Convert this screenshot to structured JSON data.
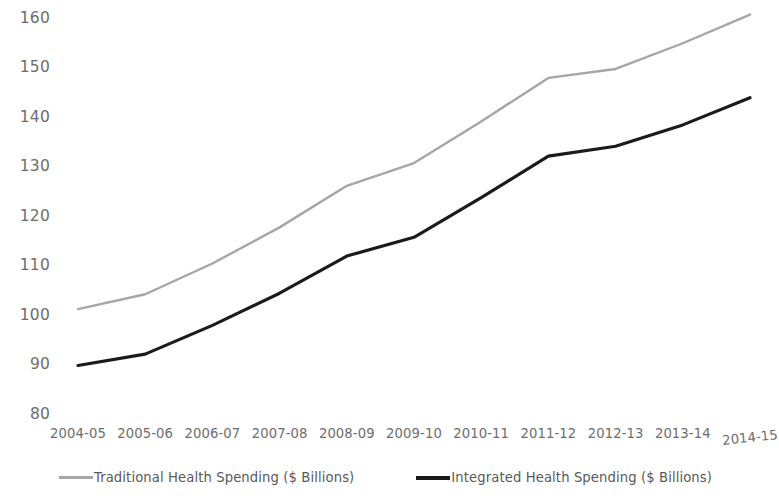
{
  "chart_data": {
    "type": "line",
    "title": "",
    "subtitle": "",
    "xlabel": "",
    "ylabel": "",
    "categories": [
      "2004-05",
      "2005-06",
      "2006-07",
      "2007-08",
      "2008-09",
      "2009-10",
      "2010-11",
      "2011-12",
      "2012-13",
      "2013-14",
      "2014-15"
    ],
    "series": [
      {
        "name": "Traditional Health Spending ($ Billions)",
        "color": "#a6a6a6",
        "values": [
          101.3,
          104.3,
          110.5,
          117.8,
          126.2,
          130.8,
          139.2,
          148.0,
          149.8,
          155.0,
          160.8
        ]
      },
      {
        "name": "Integrated Health Spending ($ Billions)",
        "color": "#1a1a1a",
        "values": [
          89.9,
          92.2,
          98.0,
          104.5,
          112.0,
          115.8,
          123.8,
          132.2,
          134.2,
          138.5,
          144.0
        ]
      }
    ],
    "ylim": [
      80,
      160
    ],
    "ytick_values": [
      80,
      90,
      100,
      110,
      120,
      130,
      140,
      150,
      160
    ],
    "ytick_labels": [
      "80",
      "90",
      "100",
      "110",
      "120",
      "130",
      "140",
      "150",
      "160"
    ],
    "grid": false,
    "legend_position": "bottom"
  },
  "legend": {
    "items": [
      {
        "label": "Traditional Health Spending ($ Billions)",
        "color": "#a6a6a6",
        "weight": "thin"
      },
      {
        "label": "Integrated Health Spending ($ Billions)",
        "color": "#1a1a1a",
        "weight": "thick"
      }
    ]
  },
  "colors": {
    "background": "#ffffff",
    "axis_text": "#6d6d6d",
    "legend_text": "#595959",
    "series_traditional": "#a6a6a6",
    "series_integrated": "#1a1a1a"
  }
}
